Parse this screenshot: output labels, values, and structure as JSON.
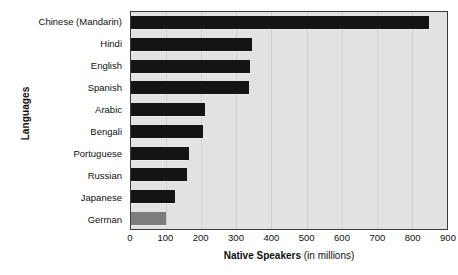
{
  "chart_data": {
    "type": "bar",
    "orientation": "horizontal",
    "title": "",
    "xlabel_bold": "Native Speakers",
    "xlabel_rest": " (in millions)",
    "ylabel": "Languages",
    "xlim": [
      0,
      900
    ],
    "xticks": [
      0,
      100,
      200,
      300,
      400,
      500,
      600,
      700,
      800,
      900
    ],
    "xtick_labels": [
      "0",
      "100",
      "200",
      "300",
      "400",
      "500",
      "600",
      "700",
      "800",
      "900"
    ],
    "grid": true,
    "legend": "none",
    "categories": [
      "Chinese (Mandarin)",
      "Hindi",
      "English",
      "Spanish",
      "Arabic",
      "Bengali",
      "Portuguese",
      "Russian",
      "Japanese",
      "German"
    ],
    "values": [
      850,
      345,
      340,
      335,
      210,
      205,
      165,
      160,
      125,
      100
    ],
    "bar_colors": [
      "#141414",
      "#141414",
      "#141414",
      "#141414",
      "#141414",
      "#141414",
      "#141414",
      "#141414",
      "#141414",
      "#7d7d7d"
    ],
    "plot_background": "#e2e2e2",
    "frame_color": "#3a3a3a",
    "gridline_color": "#d0d0d0"
  }
}
